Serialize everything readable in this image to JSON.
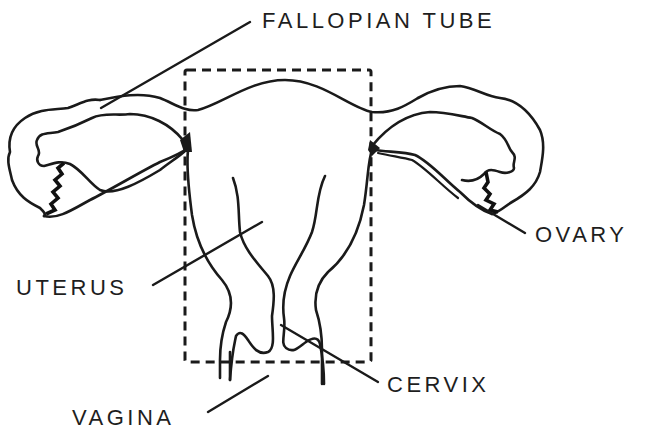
{
  "diagram": {
    "labels": {
      "fallopian_tube": "FALLOPIAN TUBE",
      "ovary": "OVARY",
      "uterus": "UTERUS",
      "cervix": "CERVIX",
      "vagina": "VAGINA"
    },
    "colors": {
      "ink": "#1a1a1a",
      "background": "#ffffff"
    }
  }
}
